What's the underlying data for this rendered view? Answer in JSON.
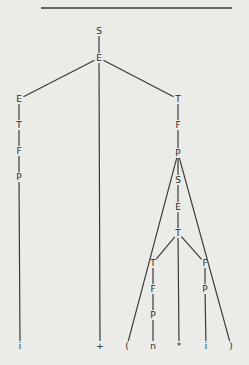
{
  "diagram": {
    "type": "parse-tree",
    "top_rule": {
      "x1": 41,
      "x2": 232,
      "y": 8
    },
    "nodes": [
      {
        "id": "n0",
        "label": "S",
        "x": 99,
        "y": 31
      },
      {
        "id": "n1",
        "label": "E",
        "x": 99,
        "y": 58
      },
      {
        "id": "n2",
        "label": "E",
        "x": 19,
        "y": 99
      },
      {
        "id": "n3",
        "label": "T",
        "x": 19,
        "y": 125
      },
      {
        "id": "n4",
        "label": "F",
        "x": 19,
        "y": 151
      },
      {
        "id": "n5",
        "label": "P",
        "x": 19,
        "y": 177
      },
      {
        "id": "n6",
        "label": "i",
        "x": 20,
        "y": 346
      },
      {
        "id": "n7",
        "label": "+",
        "x": 100,
        "y": 346
      },
      {
        "id": "n8",
        "label": "T",
        "x": 178,
        "y": 99
      },
      {
        "id": "n9",
        "label": "F",
        "x": 178,
        "y": 125
      },
      {
        "id": "n10",
        "label": "P",
        "x": 178,
        "y": 153
      },
      {
        "id": "n11",
        "label": "(",
        "x": 127,
        "y": 346
      },
      {
        "id": "n12",
        "label": "S",
        "x": 178,
        "y": 180
      },
      {
        "id": "n13",
        "label": "E",
        "x": 178,
        "y": 207
      },
      {
        "id": "n14",
        "label": "T",
        "x": 178,
        "y": 233
      },
      {
        "id": "n15",
        "label": "T",
        "x": 153,
        "y": 263
      },
      {
        "id": "n16",
        "label": "F",
        "x": 153,
        "y": 289
      },
      {
        "id": "n17",
        "label": "P",
        "x": 153,
        "y": 315
      },
      {
        "id": "n18",
        "label": "n",
        "x": 153,
        "y": 346
      },
      {
        "id": "n19",
        "label": "*",
        "x": 179,
        "y": 346
      },
      {
        "id": "n20",
        "label": "F",
        "x": 205,
        "y": 263
      },
      {
        "id": "n21",
        "label": "P",
        "x": 205,
        "y": 289
      },
      {
        "id": "n22",
        "label": "i",
        "x": 206,
        "y": 346
      },
      {
        "id": "n23",
        "label": ")",
        "x": 231,
        "y": 346
      }
    ],
    "edges": [
      [
        "n0",
        "n1"
      ],
      [
        "n1",
        "n2"
      ],
      [
        "n1",
        "n7"
      ],
      [
        "n1",
        "n8"
      ],
      [
        "n2",
        "n3"
      ],
      [
        "n3",
        "n4"
      ],
      [
        "n4",
        "n5"
      ],
      [
        "n5",
        "n6"
      ],
      [
        "n8",
        "n9"
      ],
      [
        "n9",
        "n10"
      ],
      [
        "n10",
        "n11"
      ],
      [
        "n10",
        "n12"
      ],
      [
        "n10",
        "n23"
      ],
      [
        "n12",
        "n13"
      ],
      [
        "n13",
        "n14"
      ],
      [
        "n14",
        "n15"
      ],
      [
        "n14",
        "n19"
      ],
      [
        "n14",
        "n20"
      ],
      [
        "n15",
        "n16"
      ],
      [
        "n16",
        "n17"
      ],
      [
        "n17",
        "n18"
      ],
      [
        "n20",
        "n21"
      ],
      [
        "n21",
        "n22"
      ]
    ]
  }
}
